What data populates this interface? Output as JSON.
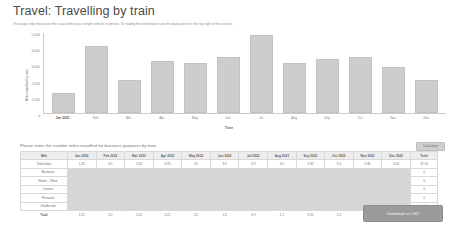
{
  "header": {
    "title": "Travel: Travelling by train",
    "subtitle": "This page only measures the usual within your single vehicle in person. To modify this information use the data points in the top right of the screen."
  },
  "chart_data": {
    "type": "bar",
    "title": "",
    "xlabel": "Time",
    "ylabel": "Miles travelled by train",
    "categories": [
      "Jan 2022",
      "Feb",
      "Mar",
      "Apr",
      "May",
      "Jun",
      "Jul",
      "Aug",
      "Sep",
      "Oct",
      "Nov",
      "Dec"
    ],
    "values": [
      1250,
      4200,
      2050,
      3250,
      3100,
      3500,
      4900,
      3100,
      3350,
      3500,
      2850,
      2050
    ],
    "ylim": [
      0,
      5000
    ],
    "yticks": [
      0,
      1000,
      2000,
      3000,
      4000,
      5000
    ],
    "ytick_labels": [
      "0",
      "1,000",
      "2,000",
      "3,000",
      "4,000",
      "5,000"
    ],
    "grid": false,
    "legend": "none",
    "bar_color": "#cdcdcd"
  },
  "table": {
    "intro": "Please enter the number miles travelled for business purposes by train",
    "calculate_label": "Calculate",
    "columns": [
      "Mile",
      "Jan 2022",
      "Feb 2022",
      "Mar 2022",
      "Apr 2022",
      "May 2022",
      "Jun 2022",
      "Jul 2022",
      "Aug 2022",
      "Sep 2022",
      "Oct 2022",
      "Nov 2022",
      "Dec 2022",
      "Total"
    ],
    "rows": [
      {
        "label": "Total miles",
        "type": "value",
        "cells": [
          "1.25",
          "4.2",
          "2.05",
          "3.25",
          "3.1",
          "3.5",
          "4.9",
          "3.1",
          "3.35",
          "3.5",
          "2.85",
          "2.05"
        ],
        "total": "37.10"
      },
      {
        "label": "Business",
        "type": "input",
        "cells": [
          "",
          "",
          "",
          "",
          "",
          "",
          "",
          "",
          "",
          "",
          "",
          ""
        ],
        "total": "0"
      },
      {
        "label": "Home - Office",
        "type": "input",
        "cells": [
          "",
          "",
          "",
          "",
          "",
          "",
          "",
          "",
          "",
          "",
          "",
          ""
        ],
        "total": "0"
      },
      {
        "label": "Leisure",
        "type": "input",
        "cells": [
          "",
          "",
          "",
          "",
          "",
          "",
          "",
          "",
          "",
          "",
          "",
          ""
        ],
        "total": "0"
      },
      {
        "label": "Personal",
        "type": "input",
        "cells": [
          "",
          "",
          "",
          "",
          "",
          "",
          "",
          "",
          "",
          "",
          "",
          ""
        ],
        "total": "0"
      },
      {
        "label": "Unaffected",
        "type": "input",
        "cells": [
          "",
          "",
          "",
          "",
          "",
          "",
          "",
          "",
          "",
          "",
          "",
          ""
        ],
        "total": "0"
      }
    ],
    "totals_row": {
      "label": "Total",
      "cells": [
        "1.25",
        "4.2",
        "2.05",
        "3.25",
        "3.1",
        "3.5",
        "4.9",
        "3.1",
        "3.35",
        "3.5",
        "2.85",
        "2.05"
      ],
      "total": "37.10"
    }
  },
  "footer": {
    "download_label": "Download as CSV"
  }
}
